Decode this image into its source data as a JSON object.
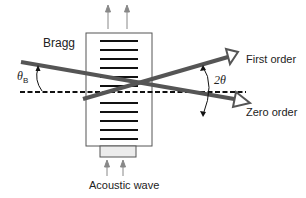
{
  "diagram": {
    "labels": {
      "bragg": "Bragg",
      "theta_b": "θ",
      "theta_b_sub": "B",
      "two_theta": "2θ",
      "first_order": "First order",
      "zero_order": "Zero order",
      "acoustic_wave": "Acoustic wave"
    },
    "colors": {
      "beam": "#555555",
      "lines": "#111111",
      "box_border": "#555555",
      "transducer_fill": "#ececec",
      "arrow_small": "#888888"
    },
    "elements": [
      {
        "name": "acousto-optic-cell",
        "type": "box"
      },
      {
        "name": "acoustic-wavefronts",
        "type": "parallel-lines",
        "count": 11
      },
      {
        "name": "transducer",
        "type": "box"
      },
      {
        "name": "incident-beam",
        "type": "arrow-line"
      },
      {
        "name": "zero-order-beam",
        "type": "arrow"
      },
      {
        "name": "first-order-beam",
        "type": "arrow"
      },
      {
        "name": "optical-axis",
        "type": "dashed-line"
      }
    ]
  }
}
